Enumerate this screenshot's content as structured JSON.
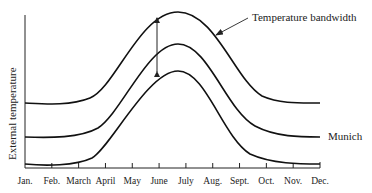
{
  "chart_data": {
    "type": "line",
    "title": "",
    "xlabel": "",
    "ylabel": "External temperature",
    "categories": [
      "Jan.",
      "Feb.",
      "March",
      "April",
      "May",
      "June",
      "July",
      "Aug.",
      "Sept.",
      "Oct.",
      "Nov.",
      "Dec."
    ],
    "series": [
      {
        "name": "upper bound",
        "values": [
          0.41,
          0.4,
          0.43,
          0.52,
          0.75,
          0.96,
          0.98,
          0.82,
          0.55,
          0.44,
          0.42,
          0.42
        ]
      },
      {
        "name": "Munich",
        "values": [
          0.2,
          0.2,
          0.22,
          0.3,
          0.54,
          0.77,
          0.78,
          0.6,
          0.34,
          0.23,
          0.21,
          0.2
        ]
      },
      {
        "name": "lower bound",
        "values": [
          0.02,
          0.01,
          0.03,
          0.12,
          0.37,
          0.59,
          0.61,
          0.44,
          0.17,
          0.06,
          0.04,
          0.03
        ]
      }
    ],
    "annotations": [
      {
        "text": "Temperature bandwidth",
        "target": "vertical double arrow spanning upper to lower curve at June"
      },
      {
        "text": "Munich",
        "target": "middle curve"
      }
    ],
    "grid": false,
    "legend": "none (inline labels)",
    "y_ticks_shown": false
  },
  "labels": {
    "ylabel": "External temperature",
    "bandwidth": "Temperature bandwidth",
    "munich": "Munich",
    "months": [
      "Jan.",
      "Feb.",
      "March",
      "April",
      "May",
      "June",
      "July",
      "Aug.",
      "Sept.",
      "Oct.",
      "Nov.",
      "Dec."
    ]
  }
}
